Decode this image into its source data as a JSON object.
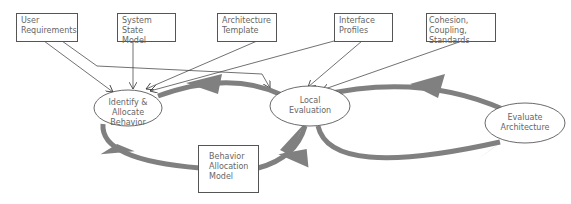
{
  "diagram": {
    "inputs": [
      {
        "id": "user-requirements",
        "lines": [
          "User",
          "Requirements"
        ]
      },
      {
        "id": "system-state-model",
        "lines": [
          "System State",
          "Model"
        ]
      },
      {
        "id": "architecture-template",
        "lines": [
          "Architecture",
          "Template"
        ]
      },
      {
        "id": "interface-profiles",
        "lines": [
          "Interface",
          "Profiles"
        ]
      },
      {
        "id": "cohesion-coupling-standards",
        "lines": [
          "Cohesion, Coupling,",
          "Standards"
        ]
      }
    ],
    "processes": [
      {
        "id": "identify-allocate",
        "lines": [
          "Identify &",
          "Allocate Behavior"
        ]
      },
      {
        "id": "local-evaluation",
        "lines": [
          "Local",
          "Evaluation"
        ]
      },
      {
        "id": "evaluate-architecture",
        "lines": [
          "Evaluate",
          "Architecture"
        ]
      }
    ],
    "artifacts": [
      {
        "id": "behavior-allocation-model",
        "lines": [
          "Behavior",
          "Allocation",
          "Model"
        ]
      }
    ],
    "colors": {
      "cycle_arrow": "#808080",
      "line": "#333333",
      "text": "#666666"
    }
  }
}
